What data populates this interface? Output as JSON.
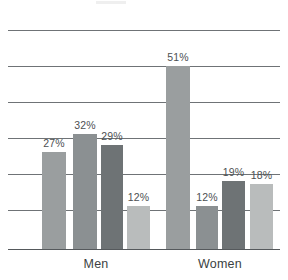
{
  "chart_data": {
    "type": "bar",
    "title": "",
    "subtitle": "",
    "xlabel": "",
    "ylabel": "",
    "ylim": [
      0,
      66
    ],
    "grid": true,
    "gridlines_percent": [
      11,
      21,
      31,
      41,
      51,
      61
    ],
    "legend_position": "none",
    "categories": [
      "Men",
      "Women"
    ],
    "series": [
      {
        "name": "series-1",
        "color": "#9a9e9f",
        "values": [
          27,
          51
        ]
      },
      {
        "name": "series-2",
        "color": "#8b9092",
        "values": [
          32,
          12
        ]
      },
      {
        "name": "series-3",
        "color": "#6e7375",
        "values": [
          29,
          19
        ]
      },
      {
        "name": "series-4",
        "color": "#b9bcbc",
        "values": [
          12,
          18
        ]
      }
    ],
    "bars": [
      {
        "group": "Men",
        "series": "series-1",
        "value": 27,
        "label": "27%",
        "color": "#9a9e9f",
        "x": 42,
        "width": 24
      },
      {
        "group": "Men",
        "series": "series-2",
        "value": 32,
        "label": "32%",
        "color": "#8b9092",
        "x": 73,
        "width": 24
      },
      {
        "group": "Men",
        "series": "series-3",
        "value": 29,
        "label": "29%",
        "color": "#6e7375",
        "x": 101,
        "width": 22
      },
      {
        "group": "Men",
        "series": "series-4",
        "value": 12,
        "label": "12%",
        "color": "#b9bcbc",
        "x": 127,
        "width": 23
      },
      {
        "group": "Women",
        "series": "series-1",
        "value": 51,
        "label": "51%",
        "color": "#9a9e9f",
        "x": 166,
        "width": 24
      },
      {
        "group": "Women",
        "series": "series-2",
        "value": 12,
        "label": "12%",
        "color": "#8b9092",
        "x": 196,
        "width": 22
      },
      {
        "group": "Women",
        "series": "series-3",
        "value": 19,
        "label": "19%",
        "color": "#6e7375",
        "x": 222,
        "width": 23
      },
      {
        "group": "Women",
        "series": "series-4",
        "value": 18,
        "label": "18%",
        "color": "#b9bcbc",
        "x": 250,
        "width": 23
      }
    ],
    "group_labels": [
      {
        "text": "Men",
        "center": 96
      },
      {
        "text": "Women",
        "center": 220
      }
    ],
    "colors": {
      "gridline": "#6f7376",
      "axis": "#55595c",
      "label_text": "#4c5052",
      "group_text": "#3b3f42",
      "background": "#ffffff"
    }
  }
}
